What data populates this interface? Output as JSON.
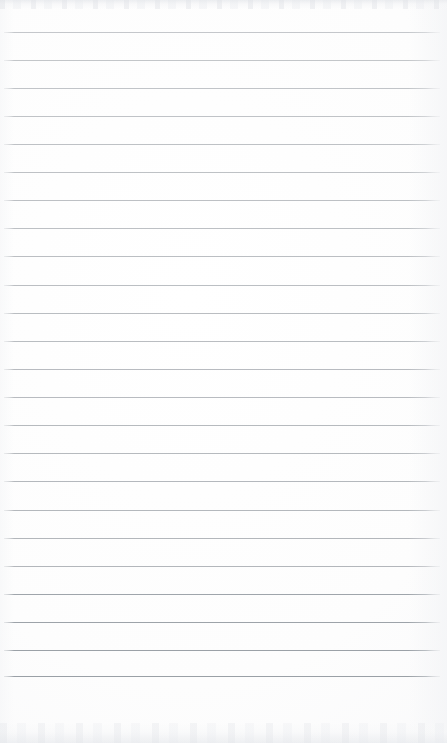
{
  "document": {
    "kind": "scanned-lined-paper",
    "orientation": "portrait",
    "page_width_px": 447,
    "page_height_px": 743,
    "has_text_content": false,
    "has_handwriting": false,
    "has_margin_rule": false,
    "has_hole_punches": false,
    "has_header": false,
    "has_footer": false,
    "has_page_number": false
  },
  "colors": {
    "paper": "#fdfdfd",
    "paper_edge_tint": "#f4f5f7",
    "rule_line": "#adb1b6",
    "rule_line_dark": "#9aa0a6",
    "scan_edge_band": "#e9ebee"
  },
  "ruling": {
    "line_count": 24,
    "first_line_y": 32,
    "spacing_px": 28,
    "line_thickness_px": 1,
    "line_start_x": 4,
    "line_end_x": 440,
    "line_length_px": 436,
    "top_margin_px": 32,
    "bottom_margin_px": 67,
    "left_margin_px": 4,
    "right_margin_px": 7,
    "lines": [
      {
        "index": 1,
        "y": 32,
        "opacity": 0.7
      },
      {
        "index": 2,
        "y": 60,
        "opacity": 0.72
      },
      {
        "index": 3,
        "y": 88,
        "opacity": 0.74
      },
      {
        "index": 4,
        "y": 116,
        "opacity": 0.76
      },
      {
        "index": 5,
        "y": 144,
        "opacity": 0.78
      },
      {
        "index": 6,
        "y": 172,
        "opacity": 0.78
      },
      {
        "index": 7,
        "y": 200,
        "opacity": 0.8
      },
      {
        "index": 8,
        "y": 228,
        "opacity": 0.8
      },
      {
        "index": 9,
        "y": 256,
        "opacity": 0.82
      },
      {
        "index": 10,
        "y": 285,
        "opacity": 0.82
      },
      {
        "index": 11,
        "y": 313,
        "opacity": 0.84
      },
      {
        "index": 12,
        "y": 341,
        "opacity": 0.84
      },
      {
        "index": 13,
        "y": 369,
        "opacity": 0.86
      },
      {
        "index": 14,
        "y": 397,
        "opacity": 0.86
      },
      {
        "index": 15,
        "y": 425,
        "opacity": 0.88
      },
      {
        "index": 16,
        "y": 453,
        "opacity": 0.88
      },
      {
        "index": 17,
        "y": 481,
        "opacity": 0.9
      },
      {
        "index": 18,
        "y": 510,
        "opacity": 0.9
      },
      {
        "index": 19,
        "y": 538,
        "opacity": 0.92
      },
      {
        "index": 20,
        "y": 566,
        "opacity": 0.92
      },
      {
        "index": 21,
        "y": 594,
        "opacity": 0.94
      },
      {
        "index": 22,
        "y": 622,
        "opacity": 0.96
      },
      {
        "index": 23,
        "y": 650,
        "opacity": 0.98
      },
      {
        "index": 24,
        "y": 676,
        "opacity": 1.0
      }
    ]
  },
  "artifacts": {
    "top_band": {
      "y": 0,
      "height": 9,
      "description": "mottled gray scanner edge"
    },
    "bottom_band": {
      "y": 723,
      "height": 20,
      "description": "mottled gray scanner edge"
    }
  }
}
